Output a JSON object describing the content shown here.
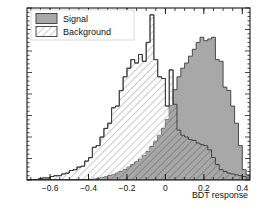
{
  "chart_data": {
    "type": "bar",
    "title": "",
    "subtitle": "",
    "xlabel": "BDT response",
    "ylabel": "",
    "xlim": [
      -0.72,
      0.44
    ],
    "ylim": [
      0,
      1.0
    ],
    "grid": false,
    "legend_position": "top-left",
    "bin_width": 0.02,
    "x_ticks": [
      -0.6,
      -0.4,
      -0.2,
      0,
      0.2,
      0.4
    ],
    "x_tick_labels": [
      "−0.6",
      "−0.4",
      "−0.2",
      "0",
      "0.2",
      "0.4"
    ],
    "y_ticks": [],
    "y_tick_labels": [],
    "bin_edges": [
      -0.72,
      -0.7,
      -0.68,
      -0.66,
      -0.64,
      -0.62,
      -0.6,
      -0.58,
      -0.56,
      -0.54,
      -0.52,
      -0.5,
      -0.48,
      -0.46,
      -0.44,
      -0.42,
      -0.4,
      -0.38,
      -0.36,
      -0.34,
      -0.32,
      -0.3,
      -0.28,
      -0.26,
      -0.24,
      -0.22,
      -0.2,
      -0.18,
      -0.16,
      -0.14,
      -0.12,
      -0.1,
      -0.08,
      -0.06,
      -0.04,
      -0.02,
      0.0,
      0.02,
      0.04,
      0.06,
      0.08,
      0.1,
      0.12,
      0.14,
      0.16,
      0.18,
      0.2,
      0.22,
      0.24,
      0.26,
      0.28,
      0.3,
      0.32,
      0.34,
      0.36,
      0.38,
      0.4,
      0.42,
      0.44
    ],
    "series": [
      {
        "name": "Signal",
        "style": "filled",
        "fill_color": "#a8a8a8",
        "line_color": "#3a3a3a",
        "values": [
          0.0,
          0.0,
          0.0,
          0.0,
          0.0,
          0.0,
          0.0,
          0.0,
          0.0,
          0.0,
          0.0,
          0.0,
          0.0,
          0.0,
          0.0,
          0.0,
          0.0,
          0.005,
          0.008,
          0.012,
          0.018,
          0.025,
          0.03,
          0.04,
          0.048,
          0.06,
          0.075,
          0.09,
          0.105,
          0.12,
          0.14,
          0.165,
          0.195,
          0.225,
          0.26,
          0.3,
          0.35,
          0.43,
          0.525,
          0.6,
          0.65,
          0.68,
          0.72,
          0.76,
          0.8,
          0.83,
          0.81,
          0.82,
          0.83,
          0.7,
          0.69,
          0.54,
          0.52,
          0.43,
          0.33,
          0.2,
          0.06,
          0.03
        ]
      },
      {
        "name": "Background",
        "style": "hatched",
        "fill_color": "#ffffff",
        "line_color": "#3a3a3a",
        "hatch": "diagonal",
        "values": [
          0.0,
          0.0,
          0.0,
          0.008,
          0.012,
          0.012,
          0.02,
          0.025,
          0.025,
          0.035,
          0.04,
          0.055,
          0.06,
          0.075,
          0.08,
          0.11,
          0.13,
          0.19,
          0.2,
          0.25,
          0.3,
          0.33,
          0.42,
          0.43,
          0.52,
          0.6,
          0.65,
          0.7,
          0.68,
          0.73,
          0.69,
          0.8,
          0.96,
          0.7,
          0.6,
          0.59,
          0.43,
          0.64,
          0.44,
          0.29,
          0.26,
          0.25,
          0.235,
          0.23,
          0.215,
          0.205,
          0.2,
          0.175,
          0.13,
          0.09,
          0.06,
          0.05,
          0.04,
          0.035,
          0.03,
          0.025,
          0.02,
          0.012
        ]
      }
    ],
    "annotations": []
  },
  "legend": {
    "items": [
      {
        "label": "Signal",
        "swatch": "solid-gray"
      },
      {
        "label": "Background",
        "swatch": "hatched-white"
      }
    ]
  },
  "axis": {
    "x_title": "BDT response"
  },
  "colors": {
    "signal_fill": "#a8a8a8",
    "signal_line": "#3a3a3a",
    "background_fill": "#ffffff",
    "background_line": "#3a3a3a",
    "frame": "#1a1a1a",
    "text": "#111111",
    "page_bg": "#ffffff"
  }
}
